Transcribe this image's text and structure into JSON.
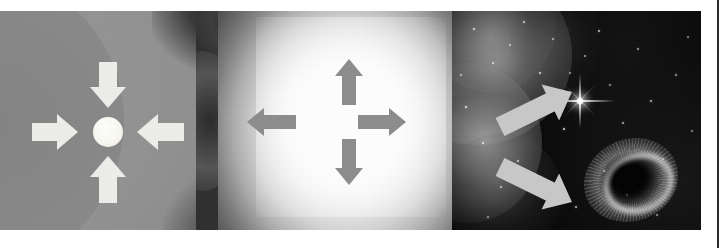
{
  "figure": {
    "width": 725,
    "height": 248,
    "background_color": "#ffffff",
    "plate_background_color": "#000000",
    "caption": ""
  },
  "panels": [
    {
      "id": "stage-1-collapse",
      "name": "gravitational-collapse",
      "title": "",
      "background_color": "#8b8b8b",
      "core_color": "#ffffff",
      "arrow_color": "#eeeeea",
      "arrow_direction": "inward",
      "arrow_count": 4,
      "arrow_labels": [
        "arrow-down-inward",
        "arrow-left-inward",
        "arrow-right-inward",
        "arrow-up-inward"
      ],
      "objects": [
        "massive-star-sphere",
        "inner-core-arc",
        "collapsing-core"
      ]
    },
    {
      "id": "stage-2-explosion",
      "name": "supernova-explosion",
      "title": "",
      "glow_color": "#ffffff",
      "arrow_color": "#8d8d8d",
      "arrow_direction": "outward",
      "arrow_count": 4,
      "arrow_labels": [
        "arrow-up-outward",
        "arrow-left-outward",
        "arrow-right-outward",
        "arrow-down-outward"
      ],
      "objects": [
        "blast-wave-glow",
        "ejecta-clouds"
      ]
    },
    {
      "id": "stage-3-remnants",
      "name": "compact-remnants",
      "title": "",
      "background_color": "#040404",
      "arrow_color": "#c9c9c9",
      "arrow_direction": "pointing-to-remnants",
      "arrow_count": 2,
      "arrow_labels": [
        "arrow-to-neutron-star",
        "arrow-to-black-hole"
      ],
      "objects": [
        "nebula-wisps",
        "star-field",
        "neutron-star",
        "black-hole-accretion-disc"
      ]
    }
  ],
  "stars": [
    {
      "x": 22,
      "y": 18,
      "r": 1.2,
      "o": 0.85
    },
    {
      "x": 41,
      "y": 52,
      "r": 1.0,
      "o": 0.7
    },
    {
      "x": 14,
      "y": 96,
      "r": 1.4,
      "o": 0.9
    },
    {
      "x": 58,
      "y": 34,
      "r": 1.0,
      "o": 0.6
    },
    {
      "x": 72,
      "y": 11,
      "r": 1.1,
      "o": 0.75
    },
    {
      "x": 31,
      "y": 132,
      "r": 1.3,
      "o": 0.8
    },
    {
      "x": 66,
      "y": 150,
      "r": 1.1,
      "o": 0.7
    },
    {
      "x": 49,
      "y": 176,
      "r": 1.0,
      "o": 0.65
    },
    {
      "x": 88,
      "y": 62,
      "r": 1.2,
      "o": 0.8
    },
    {
      "x": 101,
      "y": 28,
      "r": 1.0,
      "o": 0.6
    },
    {
      "x": 112,
      "y": 118,
      "r": 1.3,
      "o": 0.85
    },
    {
      "x": 95,
      "y": 188,
      "r": 1.1,
      "o": 0.7
    },
    {
      "x": 133,
      "y": 45,
      "r": 1.0,
      "o": 0.6
    },
    {
      "x": 147,
      "y": 20,
      "r": 1.2,
      "o": 0.75
    },
    {
      "x": 158,
      "y": 74,
      "r": 1.0,
      "o": 0.55
    },
    {
      "x": 171,
      "y": 112,
      "r": 1.1,
      "o": 0.65
    },
    {
      "x": 186,
      "y": 38,
      "r": 1.0,
      "o": 0.6
    },
    {
      "x": 199,
      "y": 90,
      "r": 1.2,
      "o": 0.7
    },
    {
      "x": 211,
      "y": 148,
      "r": 1.0,
      "o": 0.55
    },
    {
      "x": 224,
      "y": 64,
      "r": 1.1,
      "o": 0.6
    },
    {
      "x": 236,
      "y": 26,
      "r": 1.0,
      "o": 0.5
    },
    {
      "x": 124,
      "y": 196,
      "r": 1.2,
      "o": 0.7
    },
    {
      "x": 175,
      "y": 184,
      "r": 1.0,
      "o": 0.6
    },
    {
      "x": 205,
      "y": 204,
      "r": 1.1,
      "o": 0.55
    },
    {
      "x": 9,
      "y": 64,
      "r": 1.0,
      "o": 0.6
    },
    {
      "x": 78,
      "y": 104,
      "r": 1.0,
      "o": 0.6
    },
    {
      "x": 118,
      "y": 62,
      "r": 1.0,
      "o": 0.55
    },
    {
      "x": 240,
      "y": 120,
      "r": 1.0,
      "o": 0.5
    },
    {
      "x": 152,
      "y": 160,
      "r": 1.0,
      "o": 0.6
    },
    {
      "x": 36,
      "y": 206,
      "r": 1.0,
      "o": 0.55
    }
  ]
}
